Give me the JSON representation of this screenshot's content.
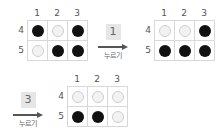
{
  "grids": [
    {
      "name": "initial-state",
      "col_labels": [
        "1",
        "2",
        "3"
      ],
      "row_labels": [
        "4",
        "5"
      ],
      "cells": [
        [
          "on",
          "off",
          "on"
        ],
        [
          "off",
          "on",
          "on"
        ]
      ]
    },
    {
      "name": "after-press-1",
      "col_labels": [
        "1",
        "2",
        "3"
      ],
      "row_labels": [
        "4",
        "5"
      ],
      "cells": [
        [
          "off",
          "off",
          "on"
        ],
        [
          "on",
          "on",
          "on"
        ]
      ]
    },
    {
      "name": "after-press-3",
      "col_labels": [
        "1",
        "2",
        "3"
      ],
      "row_labels": [
        "4",
        "5"
      ],
      "cells": [
        [
          "off",
          "off",
          "off"
        ],
        [
          "on",
          "on",
          "off"
        ]
      ]
    }
  ],
  "actions": [
    {
      "key": "1",
      "label": "누르기"
    },
    {
      "key": "3",
      "label": "누르기"
    }
  ],
  "colors": {
    "on": "#111111",
    "off": "#f2f2f2",
    "grid_line": "#d8d8d8",
    "key_bg": "#e6e6e6"
  }
}
